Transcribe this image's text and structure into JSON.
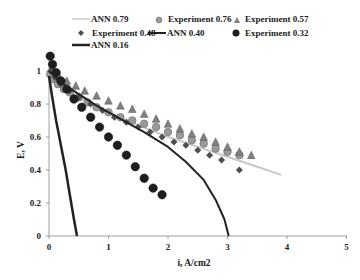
{
  "chart_data": {
    "type": "scatter",
    "title": "",
    "xlabel": "i, A/cm2",
    "ylabel": "E, V",
    "xlim": [
      0,
      5
    ],
    "ylim": [
      0,
      1.1
    ],
    "xticks": [
      0,
      1,
      2,
      3,
      4,
      5
    ],
    "yticks": [
      0,
      0.2,
      0.4,
      0.6,
      0.8,
      1
    ],
    "ytick_labels": [
      "0",
      "0.2",
      "0.4",
      "0.6",
      "0.8",
      "1"
    ],
    "grid": false,
    "legend_position": "top",
    "series": [
      {
        "name": "ANN 0.79",
        "kind": "line",
        "color": "#c8c8c8",
        "width": 2,
        "x": [
          0,
          0.1,
          0.3,
          0.6,
          1.0,
          1.5,
          2.0,
          2.5,
          3.0,
          3.5,
          3.9
        ],
        "y": [
          0.97,
          0.93,
          0.88,
          0.82,
          0.75,
          0.67,
          0.6,
          0.54,
          0.48,
          0.42,
          0.37
        ]
      },
      {
        "name": "Experiment 0.76",
        "kind": "marker",
        "marker": "circle",
        "color": "#9a9a9a",
        "x": [
          0.02,
          0.08,
          0.15,
          0.25,
          0.35,
          0.5,
          0.65,
          0.8,
          1.0,
          1.2,
          1.4,
          1.6,
          1.8,
          2.0,
          2.2,
          2.4,
          2.6,
          2.8,
          3.0,
          3.2
        ],
        "y": [
          0.98,
          0.95,
          0.92,
          0.89,
          0.87,
          0.84,
          0.81,
          0.78,
          0.75,
          0.72,
          0.7,
          0.68,
          0.66,
          0.63,
          0.61,
          0.58,
          0.56,
          0.53,
          0.51,
          0.49
        ]
      },
      {
        "name": "Experiment 0.57",
        "kind": "marker",
        "marker": "triangle",
        "color": "#808080",
        "x": [
          0.05,
          0.15,
          0.3,
          0.45,
          0.6,
          0.8,
          1.0,
          1.2,
          1.4,
          1.6,
          1.8,
          2.0,
          2.2,
          2.4,
          2.6,
          2.8,
          3.0,
          3.2,
          3.4
        ],
        "y": [
          1.02,
          0.98,
          0.94,
          0.91,
          0.88,
          0.85,
          0.82,
          0.79,
          0.77,
          0.74,
          0.71,
          0.68,
          0.65,
          0.62,
          0.6,
          0.57,
          0.54,
          0.51,
          0.49
        ]
      },
      {
        "name": "Experiment 0.48",
        "kind": "marker",
        "marker": "diamond",
        "color": "#505050",
        "x": [
          0.03,
          0.1,
          0.2,
          0.35,
          0.5,
          0.7,
          0.9,
          1.1,
          1.3,
          1.5,
          1.7,
          1.9,
          2.1,
          2.3,
          2.5,
          2.7,
          2.9,
          3.2
        ],
        "y": [
          1.0,
          0.96,
          0.92,
          0.88,
          0.84,
          0.8,
          0.76,
          0.72,
          0.69,
          0.66,
          0.63,
          0.6,
          0.57,
          0.55,
          0.52,
          0.49,
          0.46,
          0.4
        ]
      },
      {
        "name": "ANN 0.40",
        "kind": "line",
        "color": "#222222",
        "width": 2,
        "x": [
          0,
          0.2,
          0.5,
          0.8,
          1.2,
          1.6,
          2.0,
          2.3,
          2.6,
          2.8,
          2.95,
          3.02
        ],
        "y": [
          1.0,
          0.93,
          0.86,
          0.79,
          0.71,
          0.63,
          0.54,
          0.45,
          0.34,
          0.22,
          0.1,
          0.0
        ]
      },
      {
        "name": "Experiment 0.32",
        "kind": "marker",
        "marker": "circle",
        "color": "#1e1e1e",
        "x": [
          0.02,
          0.06,
          0.12,
          0.2,
          0.3,
          0.42,
          0.55,
          0.7,
          0.85,
          1.0,
          1.15,
          1.3,
          1.45,
          1.6,
          1.75,
          1.9
        ],
        "y": [
          1.09,
          1.04,
          0.99,
          0.94,
          0.89,
          0.83,
          0.78,
          0.72,
          0.66,
          0.6,
          0.55,
          0.49,
          0.42,
          0.35,
          0.29,
          0.25
        ]
      },
      {
        "name": "ANN 0.16",
        "kind": "line",
        "color": "#222222",
        "width": 2.5,
        "x": [
          0,
          0.05,
          0.12,
          0.2,
          0.28,
          0.35,
          0.42,
          0.47
        ],
        "y": [
          0.97,
          0.85,
          0.7,
          0.55,
          0.4,
          0.25,
          0.1,
          0.0
        ]
      }
    ]
  },
  "legend": {
    "items": [
      {
        "label": "ANN 0.79"
      },
      {
        "label": "Experiment 0.76"
      },
      {
        "label": "Experiment 0.57"
      },
      {
        "label": "Experiment 0.48"
      },
      {
        "label": "ANN 0.40"
      },
      {
        "label": "Experiment 0.32"
      },
      {
        "label": "ANN 0.16"
      }
    ]
  },
  "axes": {
    "xlabel": "i, A/cm2",
    "ylabel": "E, V",
    "xticks": [
      "0",
      "1",
      "2",
      "3",
      "4",
      "5"
    ],
    "yticks": [
      "0",
      "0.2",
      "0.4",
      "0.6",
      "0.8",
      "1"
    ]
  }
}
